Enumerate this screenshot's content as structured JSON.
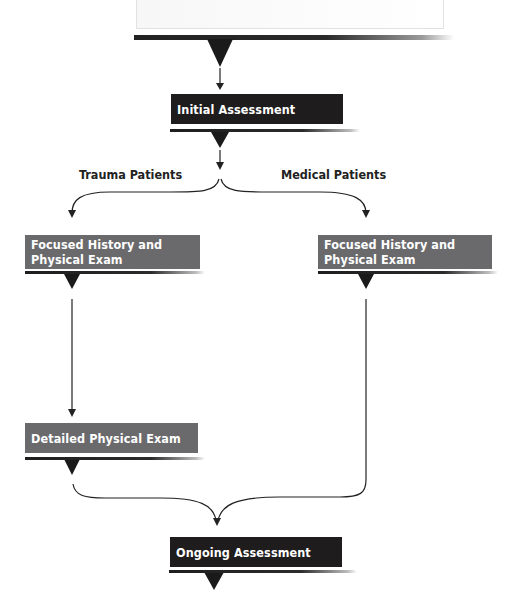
{
  "diagram": {
    "type": "flowchart",
    "nodes": {
      "initial_assessment": "Initial Assessment",
      "focused_trauma": "Focused History and Physical Exam",
      "focused_medical": "Focused History and Physical Exam",
      "detailed_exam": "Detailed Physical Exam",
      "ongoing_assessment": "Ongoing Assessment"
    },
    "branch_labels": {
      "trauma": "Trauma Patients",
      "medical": "Medical Patients"
    },
    "colors": {
      "dark_box": "#1e1c1d",
      "grey_box": "#6a6a6d",
      "line": "#222222"
    },
    "edges": [
      {
        "from": "top_box",
        "to": "initial_assessment"
      },
      {
        "from": "initial_assessment",
        "to": "focused_trauma",
        "label": "Trauma Patients"
      },
      {
        "from": "initial_assessment",
        "to": "focused_medical",
        "label": "Medical Patients"
      },
      {
        "from": "focused_trauma",
        "to": "detailed_exam"
      },
      {
        "from": "detailed_exam",
        "to": "ongoing_assessment"
      },
      {
        "from": "focused_medical",
        "to": "ongoing_assessment"
      }
    ]
  }
}
